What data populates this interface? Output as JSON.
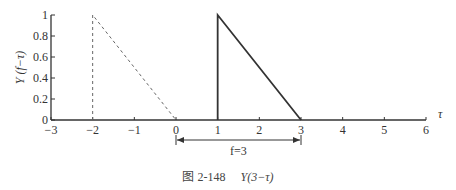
{
  "chart_data": {
    "type": "line",
    "title": "",
    "caption_number": "图 2-148",
    "caption_formula": "Y(3−τ)",
    "xlabel": "τ",
    "ylabel": "Y (f−τ)",
    "xlim": [
      -3,
      6
    ],
    "ylim": [
      0,
      1
    ],
    "xticks": [
      -3,
      -2,
      -1,
      0,
      1,
      2,
      3,
      4,
      5,
      6
    ],
    "yticks": [
      0,
      0.2,
      0.4,
      0.6,
      0.8,
      1
    ],
    "xtick_labels": [
      "−3",
      "−2",
      "−1",
      "0",
      "1",
      "2",
      "3",
      "4",
      "5",
      "6"
    ],
    "ytick_labels": [
      "0",
      "0.2",
      "0.4",
      "0.6",
      "0.8",
      "1"
    ],
    "grid": false,
    "series": [
      {
        "name": "Y(−τ) (dashed, reflected)",
        "style": "dashed",
        "x": [
          -2,
          -2,
          0
        ],
        "y": [
          0,
          1,
          0
        ]
      },
      {
        "name": "Y(3−τ) (solid, shifted by f=3)",
        "style": "solid",
        "x": [
          1,
          1,
          3
        ],
        "y": [
          0,
          1,
          0
        ]
      }
    ],
    "annotations": [
      {
        "type": "double-arrow",
        "from": 0,
        "to": 3,
        "label": "f=3"
      }
    ]
  }
}
